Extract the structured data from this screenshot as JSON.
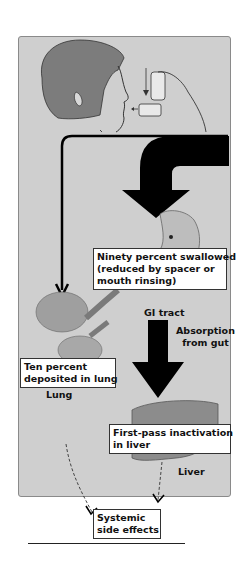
{
  "diagram": {
    "labels": {
      "swallowed": "Ninety percent swallowed",
      "swallowed_line2": "(reduced by spacer or",
      "swallowed_line3": "mouth rinsing)",
      "lung_deposit": "Ten percent",
      "lung_deposit_line2": "deposited in lung",
      "first_pass": "First-pass inactivation",
      "first_pass_line2": "in liver",
      "systemic": "Systemic",
      "systemic_line2": "side effects"
    },
    "organ_labels": {
      "gi_tract": "GI tract",
      "absorption": "Absorption",
      "absorption_line2": "from gut",
      "lung": "Lung",
      "liver": "Liver"
    },
    "colors": {
      "panel": "#cfcfcf",
      "arrow": "#000000",
      "organ": "#8c8c8c"
    }
  }
}
